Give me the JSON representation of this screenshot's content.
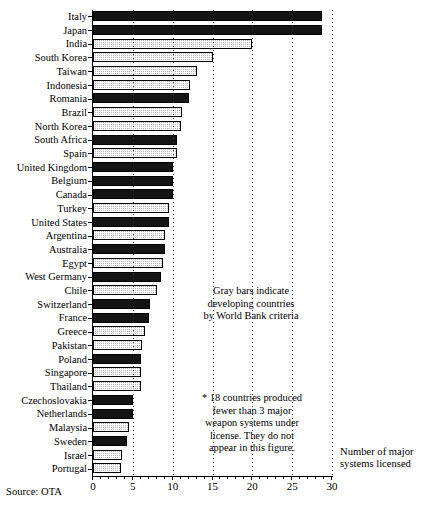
{
  "chart_data": {
    "type": "bar",
    "orientation": "horizontal",
    "title": "",
    "xlabel": "Number of major systems licensed",
    "ylabel": "",
    "xlim": [
      0,
      30
    ],
    "xticks": [
      0,
      5,
      10,
      15,
      20,
      25,
      30
    ],
    "xticklabels": [
      "0",
      "5",
      "10",
      "15",
      "20",
      "25",
      "30"
    ],
    "grid": true,
    "grid_axis": "x",
    "legend": "none",
    "categories": [
      "Italy",
      "Japan",
      "India",
      "South Korea",
      "Taiwan",
      "Indonesia",
      "Romania",
      "Brazil",
      "North Korea",
      "South Africa",
      "Spain",
      "United Kingdom",
      "Belgium",
      "Canada",
      "Turkey",
      "United States",
      "Argentina",
      "Australia",
      "Egypt",
      "West Germany",
      "Chile",
      "Switzerland",
      "France",
      "Greece",
      "Pakistan",
      "Poland",
      "Singapore",
      "Thailand",
      "Czechoslovakia",
      "Netherlands",
      "Malaysia",
      "Sweden",
      "Israel",
      "Portugal"
    ],
    "values": [
      28.7,
      28.7,
      20.0,
      15.0,
      13.0,
      12.2,
      12.0,
      11.2,
      11.0,
      10.5,
      10.5,
      10.0,
      10.0,
      10.0,
      9.6,
      9.5,
      9.0,
      9.0,
      8.8,
      8.5,
      8.0,
      7.2,
      7.0,
      6.5,
      6.2,
      6.0,
      6.0,
      6.0,
      5.0,
      5.0,
      4.5,
      4.3,
      3.6,
      3.5
    ],
    "bar_styles": [
      "black",
      "black",
      "gray",
      "gray",
      "gray",
      "gray",
      "black",
      "gray",
      "gray",
      "black",
      "gray",
      "black",
      "black",
      "black",
      "gray",
      "black",
      "gray",
      "black",
      "gray",
      "black",
      "gray",
      "black",
      "black",
      "gray",
      "gray",
      "black",
      "gray",
      "gray",
      "black",
      "black",
      "gray",
      "black",
      "gray",
      "gray"
    ],
    "annotations": [
      "Gray bars indicate developing countries by World Bank criteria",
      "* 18 countries produced fewer than 3 major weapon systems under license. They do not appear in this figure."
    ],
    "source": "Source: OTA"
  },
  "legend_note": {
    "line1": "Gray bars indicate",
    "line2": "developing countries",
    "line3": "by World Bank criteria"
  },
  "footnote": {
    "line1": "* 18 countries produced",
    "line2": "fewer than 3 major",
    "line3": "weapon systems under",
    "line4": "license. They do not",
    "line5": "appear in this figure."
  },
  "axis_title": {
    "line1": "Number of major",
    "line2": "systems licensed"
  },
  "source": {
    "text": "Source: OTA"
  },
  "colors": {
    "bar_black": "#141414",
    "bar_gray": "#b9b9b9",
    "axis": "#000000",
    "background": "#ffffff"
  }
}
